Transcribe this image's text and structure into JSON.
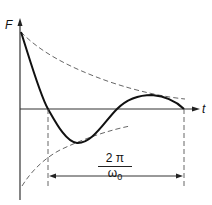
{
  "diagram": {
    "y_axis_label": "F",
    "x_axis_label": "t",
    "period_label": {
      "numerator": "2 π",
      "denominator": "ω",
      "denominator_subscript": "0"
    },
    "elements": [
      "damped-curve",
      "upper-envelope-dashed",
      "lower-envelope-dashed",
      "period-dimension-arrow"
    ]
  }
}
